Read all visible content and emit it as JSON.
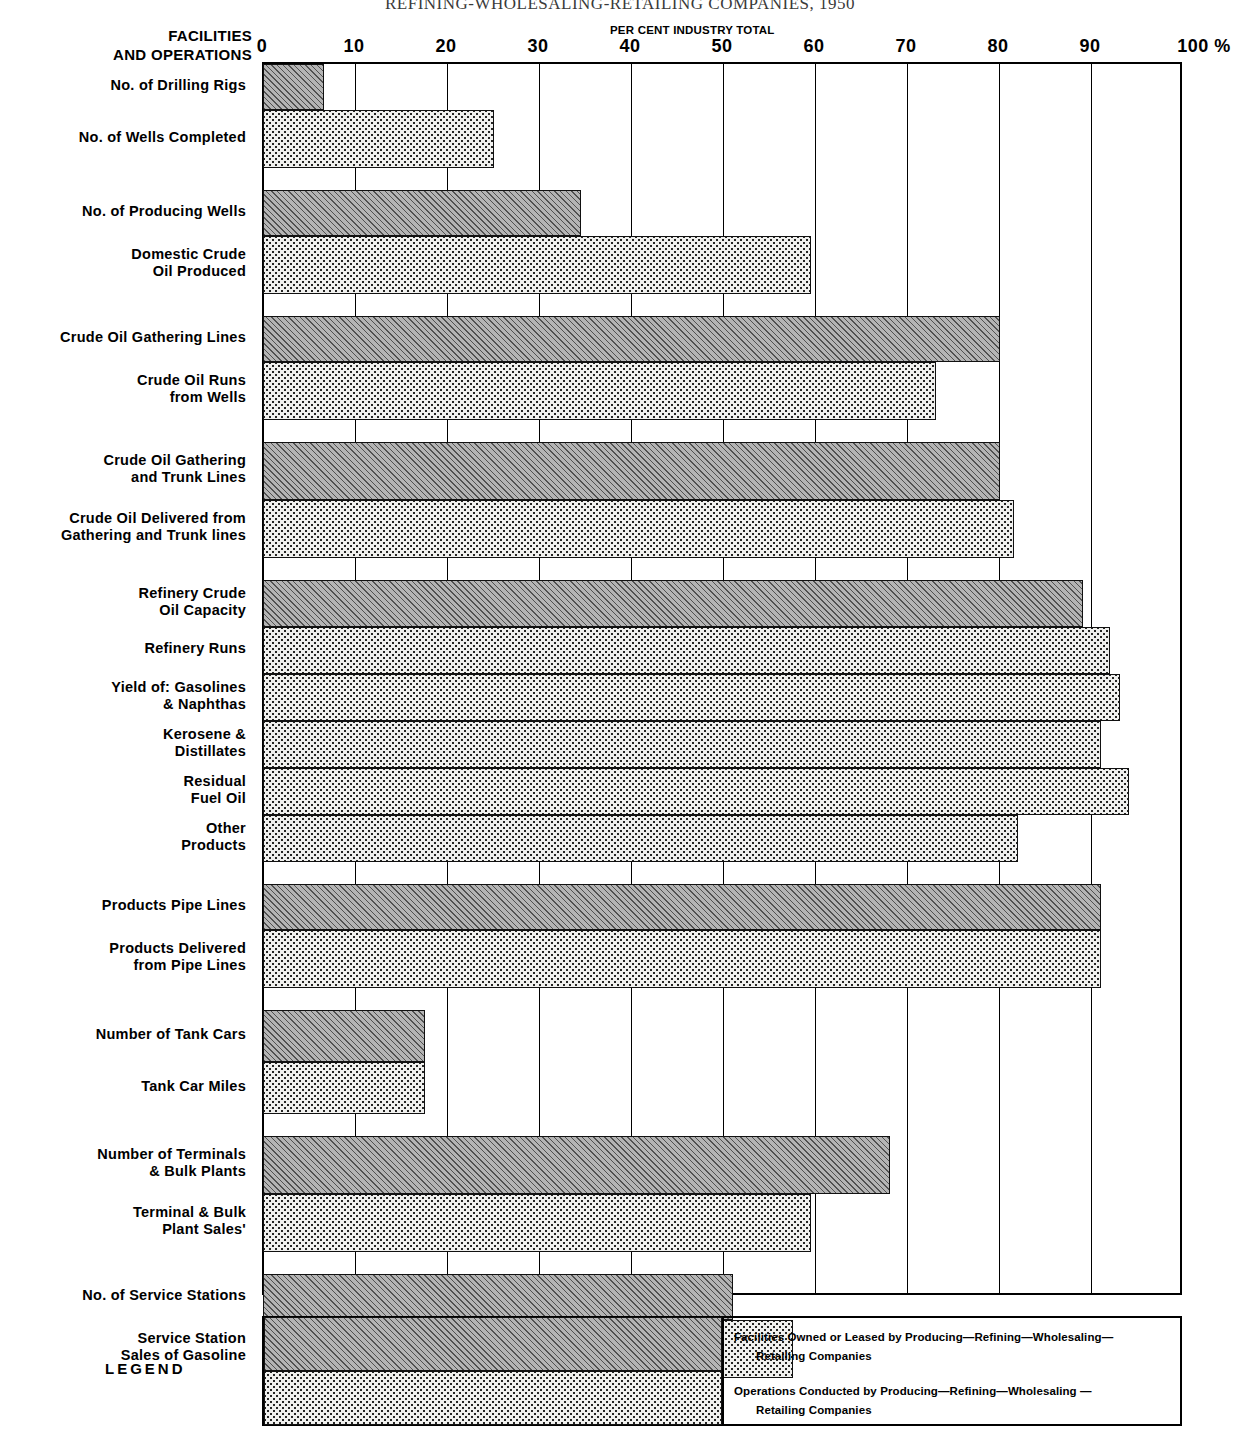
{
  "chart_data": {
    "type": "bar",
    "orientation": "horizontal",
    "title": "REFINING-WHOLESALING-RETAILING COMPANIES, 1950",
    "axis_caption": "PER CENT INDUSTRY TOTAL",
    "column_header_line1": "FACILITIES",
    "column_header_line2": "AND OPERATIONS",
    "xlabel": "PER CENT INDUSTRY TOTAL",
    "ylabel": "",
    "xlim": [
      0,
      100
    ],
    "grid": true,
    "tick_labels": [
      "0",
      "10",
      "20",
      "30",
      "40",
      "50",
      "60",
      "70",
      "80",
      "90",
      "100 %"
    ],
    "tick_values": [
      0,
      10,
      20,
      30,
      40,
      50,
      60,
      70,
      80,
      90,
      100
    ],
    "series": [
      {
        "name": "Facilities Owned or Leased by Producing-Refining-Wholesaling-Retailing Companies",
        "key": "owned"
      },
      {
        "name": "Operations Conducted by Producing-Refining-Wholesaling-Retailing Companies",
        "key": "ops"
      }
    ],
    "groups": [
      {
        "rows": [
          {
            "label": "No. of Drilling Rigs",
            "label_lines": [
              "No. of Drilling Rigs"
            ],
            "value": 6.5,
            "type": "owned"
          },
          {
            "label": "No. of Wells Completed",
            "label_lines": [
              "No. of Wells Completed"
            ],
            "value": 25,
            "type": "ops"
          }
        ]
      },
      {
        "rows": [
          {
            "label": "No. of Producing Wells",
            "label_lines": [
              "No. of Producing Wells"
            ],
            "value": 34.5,
            "type": "owned"
          },
          {
            "label": "Domestic Crude Oil Produced",
            "label_lines": [
              "Domestic Crude",
              "Oil Produced"
            ],
            "value": 59.5,
            "type": "ops"
          }
        ]
      },
      {
        "rows": [
          {
            "label": "Crude Oil Gathering Lines",
            "label_lines": [
              "Crude Oil Gathering Lines"
            ],
            "value": 80,
            "type": "owned"
          },
          {
            "label": "Crude Oil Runs from Wells",
            "label_lines": [
              "Crude Oil Runs",
              "from Wells"
            ],
            "value": 73,
            "type": "ops"
          }
        ]
      },
      {
        "rows": [
          {
            "label": "Crude Oil Gathering and Trunk Lines",
            "label_lines": [
              "Crude Oil Gathering",
              "and Trunk Lines"
            ],
            "value": 80,
            "type": "owned"
          },
          {
            "label": "Crude Oil Delivered from Gathering and Trunk lines",
            "label_lines": [
              "Crude Oil Delivered from",
              "Gathering and Trunk lines"
            ],
            "value": 81.5,
            "type": "ops"
          }
        ]
      },
      {
        "rows": [
          {
            "label": "Refinery Crude Oil Capacity",
            "label_lines": [
              "Refinery Crude",
              "Oil Capacity"
            ],
            "value": 89,
            "type": "owned"
          },
          {
            "label": "Refinery Runs",
            "label_lines": [
              "Refinery Runs"
            ],
            "value": 92,
            "type": "ops"
          },
          {
            "label": "Yield of: Gasolines & Naphthas",
            "label_lines": [
              "Yield of:  Gasolines",
              "& Naphthas"
            ],
            "value": 93,
            "type": "ops"
          },
          {
            "label": "Kerosene & Distillates",
            "label_lines": [
              "Kerosene &",
              "Distillates"
            ],
            "value": 91,
            "type": "ops"
          },
          {
            "label": "Residual Fuel Oil",
            "label_lines": [
              "Residual",
              "Fuel Oil"
            ],
            "value": 94,
            "type": "ops"
          },
          {
            "label": "Other Products",
            "label_lines": [
              "Other",
              "Products"
            ],
            "value": 82,
            "type": "ops"
          }
        ]
      },
      {
        "rows": [
          {
            "label": "Products Pipe Lines",
            "label_lines": [
              "Products Pipe Lines"
            ],
            "value": 91,
            "type": "owned"
          },
          {
            "label": "Products Delivered from Pipe Lines",
            "label_lines": [
              "Products Delivered",
              "from Pipe Lines"
            ],
            "value": 91,
            "type": "ops"
          }
        ]
      },
      {
        "rows": [
          {
            "label": "Number of Tank Cars",
            "label_lines": [
              "Number of Tank Cars"
            ],
            "value": 17.5,
            "type": "owned"
          },
          {
            "label": "Tank Car Miles",
            "label_lines": [
              "Tank Car Miles"
            ],
            "value": 17.5,
            "type": "ops"
          }
        ]
      },
      {
        "rows": [
          {
            "label": "Number of Terminals & Bulk Plants",
            "label_lines": [
              "Number of Terminals",
              "& Bulk Plants"
            ],
            "value": 68,
            "type": "owned"
          },
          {
            "label": "Terminal & Bulk Plant Sales'",
            "label_lines": [
              "Terminal & Bulk",
              "Plant Sales'"
            ],
            "value": 59.5,
            "type": "ops"
          }
        ]
      },
      {
        "rows": [
          {
            "label": "No. of Service Stations",
            "label_lines": [
              "No. of Service Stations"
            ],
            "value": 51,
            "type": "owned"
          },
          {
            "label": "Service Station Sales of Gasoline",
            "label_lines": [
              "Service Station",
              "Sales of Gasoline"
            ],
            "value": 57.5,
            "type": "ops"
          }
        ]
      }
    ]
  },
  "legend": {
    "word": "LEGEND",
    "entries": [
      {
        "type": "owned",
        "line1": "Facilities Owned or Leased by Producing—Refining—Wholesaling—",
        "line2": "Retailing  Companies"
      },
      {
        "type": "ops",
        "line1": "Operations Conducted  by  Producing—Refining—Wholesaling —",
        "line2": "Retailing  Companies"
      }
    ]
  },
  "colors": {
    "owned_fill": "#b4b4b4",
    "ops_fill": "#f0f0ee",
    "line": "#000000"
  }
}
